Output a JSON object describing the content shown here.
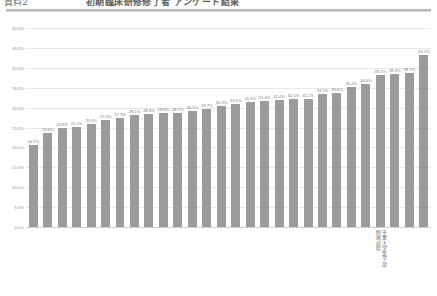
{
  "header": {
    "title_left": "資料2",
    "title_main": "初期臨床研修修了者 アンケート結果",
    "note": ""
  },
  "chart_data": {
    "type": "bar",
    "title": "初期臨床研修修了者 アンケート結果",
    "xlabel": "",
    "ylabel": "",
    "ylim": [
      0,
      50
    ],
    "ytick_format": "percent",
    "grid": true,
    "legend": "none",
    "bar_color": "#9b9b9b",
    "yticks": [
      "0.0%",
      "5.0%",
      "10.0%",
      "15.0%",
      "20.0%",
      "25.0%",
      "30.0%",
      "35.0%",
      "40.0%",
      "45.0%",
      "50.0%"
    ],
    "ytick_values": [
      0,
      5,
      10,
      15,
      20,
      25,
      30,
      35,
      40,
      45,
      50
    ],
    "categories": [
      "",
      "",
      "",
      "",
      "",
      "",
      "",
      "",
      "",
      "",
      "",
      "",
      "",
      "",
      "",
      "",
      "",
      "",
      "",
      "",
      "",
      "",
      "",
      "",
      "千葉大学医学部\n附属病院",
      "",
      "",
      ""
    ],
    "values": [
      20.7,
      23.6,
      24.8,
      25.1,
      25.9,
      27.0,
      27.3,
      28.1,
      28.3,
      28.6,
      28.7,
      29.1,
      29.7,
      30.3,
      31.0,
      32.0,
      32.1,
      32.2,
      33.5,
      33.6,
      35.2,
      36.0,
      38.1,
      38.4,
      38.7,
      43.1,
      31.5,
      31.6
    ],
    "value_labels": [
      "20.7%",
      "23.6%",
      "24.8%",
      "25.1%",
      "25.9%",
      "27.0%",
      "27.3%",
      "28.1%",
      "28.3%",
      "28.6%",
      "28.7%",
      "29.1%",
      "29.7%",
      "30.3%",
      "31.0%",
      "31.5%",
      "31.6%",
      "32.0%",
      "32.1%",
      "32.2%",
      "33.5%",
      "33.6%",
      "35.2%",
      "36.0%",
      "38.1%",
      "38.4%",
      "38.7%",
      "43.1%"
    ],
    "ordered_values": [
      20.7,
      23.6,
      24.8,
      25.1,
      25.9,
      27.0,
      27.3,
      28.1,
      28.3,
      28.6,
      28.7,
      29.1,
      29.7,
      30.3,
      31.0,
      31.5,
      31.6,
      32.0,
      32.1,
      32.2,
      33.5,
      33.6,
      35.2,
      36.0,
      38.1,
      38.4,
      38.7,
      43.1
    ],
    "highlight_index": 24,
    "highlight_label_lines": [
      "千葉大学医学部",
      "附属病院"
    ],
    "bar_count": 28,
    "annotations": []
  }
}
